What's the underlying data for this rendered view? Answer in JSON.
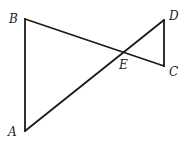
{
  "diagram": {
    "type": "geometry",
    "points": [
      {
        "name": "A",
        "x": 25,
        "y": 131,
        "label_x": 8,
        "label_y": 136
      },
      {
        "name": "B",
        "x": 25,
        "y": 19,
        "label_x": 9,
        "label_y": 23
      },
      {
        "name": "C",
        "x": 164,
        "y": 66,
        "label_x": 169,
        "label_y": 76
      },
      {
        "name": "D",
        "x": 164,
        "y": 20,
        "label_x": 169,
        "label_y": 20
      },
      {
        "name": "E",
        "x": 124,
        "y": 52,
        "label_x": 119,
        "label_y": 69
      }
    ],
    "segments": [
      {
        "from": "A",
        "to": "B"
      },
      {
        "from": "B",
        "to": "C"
      },
      {
        "from": "C",
        "to": "D"
      },
      {
        "from": "D",
        "to": "A"
      }
    ],
    "labels": {
      "A": "A",
      "B": "B",
      "C": "C",
      "D": "D",
      "E": "E"
    },
    "line_color": "#1a1a1a"
  }
}
